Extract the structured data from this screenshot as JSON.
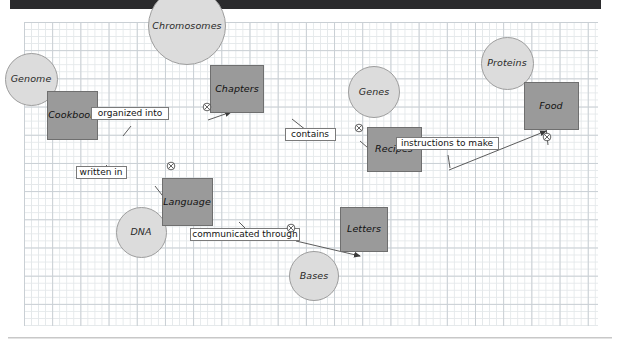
{
  "diagram": {
    "background": "graph-paper",
    "colors": {
      "rect_fill": "#9a9a9a",
      "rect_border": "#6f6f6f",
      "circle_fill": "#dcdcdc",
      "circle_border": "#9d9d9d",
      "grid_minor": "#e4e8ea",
      "grid_major": "#c9cfd4",
      "topbar": "#2b2b2d",
      "edge_line": "#444444",
      "label_box_border": "#7a7a7a"
    },
    "nodes": [
      {
        "id": "genome",
        "label": "Genome",
        "shape": "circle",
        "x": 31,
        "y": 79,
        "w": 53,
        "h": 53
      },
      {
        "id": "chromosomes",
        "label": "Chromosomes",
        "shape": "circle",
        "x": 187,
        "y": 26,
        "w": 78,
        "h": 78
      },
      {
        "id": "genes",
        "label": "Genes",
        "shape": "circle",
        "x": 374,
        "y": 92,
        "w": 52,
        "h": 52
      },
      {
        "id": "proteins",
        "label": "Proteins",
        "shape": "circle",
        "x": 507,
        "y": 63,
        "w": 53,
        "h": 53
      },
      {
        "id": "dna",
        "label": "DNA",
        "shape": "circle",
        "x": 141,
        "y": 232,
        "w": 51,
        "h": 51
      },
      {
        "id": "bases",
        "label": "Bases",
        "shape": "circle",
        "x": 314,
        "y": 276,
        "w": 50,
        "h": 50
      },
      {
        "id": "cookbook",
        "label": "Cookbook",
        "shape": "rect",
        "x": 72,
        "y": 115,
        "w": 51,
        "h": 49
      },
      {
        "id": "chapters",
        "label": "Chapters",
        "shape": "rect",
        "x": 237,
        "y": 89,
        "w": 54,
        "h": 48
      },
      {
        "id": "recipes",
        "label": "Recipes",
        "shape": "rect",
        "x": 394,
        "y": 149,
        "w": 55,
        "h": 45
      },
      {
        "id": "food",
        "label": "Food",
        "shape": "rect",
        "x": 551,
        "y": 106,
        "w": 55,
        "h": 48
      },
      {
        "id": "language",
        "label": "Language",
        "shape": "rect",
        "x": 187,
        "y": 202,
        "w": 51,
        "h": 48
      },
      {
        "id": "letters",
        "label": "Letters",
        "shape": "rect",
        "x": 364,
        "y": 229,
        "w": 48,
        "h": 45
      }
    ],
    "edges": [
      {
        "id": "edge-organized-into",
        "label": "organized into",
        "from": "cookbook",
        "to": "chapters",
        "label_x": 130,
        "label_y": 113,
        "label_w": 78,
        "icon_x": 207,
        "icon_y": 107
      },
      {
        "id": "edge-contains",
        "label": "contains",
        "from": "chapters",
        "to": "recipes",
        "label_x": 310,
        "label_y": 134,
        "label_w": 51,
        "icon_x": 359,
        "icon_y": 128
      },
      {
        "id": "edge-instructions-to-make",
        "label": "instructions to make",
        "from": "recipes",
        "to": "food",
        "label_x": 447,
        "label_y": 143,
        "label_w": 103,
        "icon_x": 547,
        "icon_y": 137
      },
      {
        "id": "edge-written-in",
        "label": "written in",
        "from": "cookbook",
        "to": "language",
        "label_x": 101,
        "label_y": 172,
        "label_w": 51,
        "icon_x": 171,
        "icon_y": 166
      },
      {
        "id": "edge-communicated-through",
        "label": "communicated through",
        "from": "language",
        "to": "letters",
        "label_x": 245,
        "label_y": 234,
        "label_w": 110,
        "icon_x": 291,
        "icon_y": 228
      }
    ],
    "icon": {
      "name": "circled-x-icon",
      "glyph": "⊗"
    }
  }
}
